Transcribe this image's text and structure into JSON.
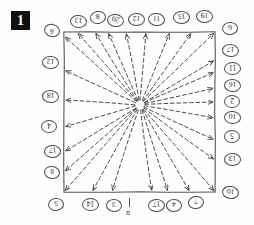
{
  "figure": {
    "badge_label": "1",
    "caption_glyph": "n",
    "ink_color": "#3a3a3a",
    "box_color": "#555555",
    "background_color": "#fefefe"
  },
  "chart_data": {
    "type": "scatter",
    "title": "",
    "xlabel": "",
    "ylabel": "",
    "source_point": {
      "x": 140,
      "y": 105
    },
    "box": {
      "left": 64,
      "top": 32,
      "right": 215,
      "bottom": 192
    },
    "grid": false,
    "legend": false,
    "arrows": [
      {
        "id": 1,
        "label": "9",
        "side": "left",
        "tip_x": 64,
        "tip_y": 36,
        "label_x": 44,
        "label_y": 24,
        "rot": 15
      },
      {
        "id": 2,
        "label": "13",
        "side": "top",
        "tip_x": 77,
        "tip_y": 32,
        "label_x": 70,
        "label_y": 15,
        "rot": 185
      },
      {
        "id": 3,
        "label": "8",
        "side": "top",
        "tip_x": 95,
        "tip_y": 32,
        "label_x": 90,
        "label_y": 11,
        "rot": 170
      },
      {
        "id": 4,
        "label": "20",
        "side": "top",
        "tip_x": 108,
        "tip_y": 32,
        "label_x": 107,
        "label_y": 14,
        "rot": 190
      },
      {
        "id": 5,
        "label": "12",
        "side": "top",
        "tip_x": 126,
        "tip_y": 32,
        "label_x": 128,
        "label_y": 13,
        "rot": 182
      },
      {
        "id": 6,
        "label": "11",
        "side": "top",
        "tip_x": 146,
        "tip_y": 32,
        "label_x": 148,
        "label_y": 13,
        "rot": 186
      },
      {
        "id": 7,
        "label": "15",
        "side": "top",
        "tip_x": 170,
        "tip_y": 32,
        "label_x": 173,
        "label_y": 11,
        "rot": 178
      },
      {
        "id": 8,
        "label": "19",
        "side": "top",
        "tip_x": 192,
        "tip_y": 32,
        "label_x": 196,
        "label_y": 10,
        "rot": 182
      },
      {
        "id": 9,
        "label": "6",
        "side": "corner",
        "tip_x": 215,
        "tip_y": 32,
        "label_x": 222,
        "label_y": 22,
        "rot": 176
      },
      {
        "id": 10,
        "label": "17",
        "side": "right",
        "tip_x": 215,
        "tip_y": 60,
        "label_x": 222,
        "label_y": 44,
        "rot": 183
      },
      {
        "id": 11,
        "label": "11",
        "side": "right",
        "tip_x": 215,
        "tip_y": 72,
        "label_x": 224,
        "label_y": 62,
        "rot": 180
      },
      {
        "id": 12,
        "label": "16",
        "side": "right",
        "tip_x": 215,
        "tip_y": 88,
        "label_x": 224,
        "label_y": 79,
        "rot": 184
      },
      {
        "id": 13,
        "label": "2",
        "side": "right",
        "tip_x": 215,
        "tip_y": 102,
        "label_x": 224,
        "label_y": 95,
        "rot": 180
      },
      {
        "id": 14,
        "label": "10",
        "side": "right",
        "tip_x": 215,
        "tip_y": 118,
        "label_x": 224,
        "label_y": 111,
        "rot": 185
      },
      {
        "id": 15,
        "label": "5",
        "side": "right",
        "tip_x": 215,
        "tip_y": 140,
        "label_x": 224,
        "label_y": 130,
        "rot": 180
      },
      {
        "id": 16,
        "label": "13",
        "side": "right",
        "tip_x": 215,
        "tip_y": 160,
        "label_x": 224,
        "label_y": 153,
        "rot": 182
      },
      {
        "id": 17,
        "label": "10",
        "side": "corner",
        "tip_x": 215,
        "tip_y": 192,
        "label_x": 222,
        "label_y": 186,
        "rot": 188
      },
      {
        "id": 18,
        "label": "7",
        "side": "bottom",
        "tip_x": 190,
        "tip_y": 192,
        "label_x": 188,
        "label_y": 196,
        "rot": 174
      },
      {
        "id": 19,
        "label": "4",
        "side": "bottom",
        "tip_x": 168,
        "tip_y": 192,
        "label_x": 166,
        "label_y": 199,
        "rot": 182
      },
      {
        "id": 20,
        "label": "17",
        "side": "bottom",
        "tip_x": 152,
        "tip_y": 192,
        "label_x": 148,
        "label_y": 199,
        "rot": 178
      },
      {
        "id": 21,
        "label": "3",
        "side": "bottom",
        "tip_x": 112,
        "tip_y": 192,
        "label_x": 106,
        "label_y": 199,
        "rot": 184
      },
      {
        "id": 22,
        "label": "14",
        "side": "bottom",
        "tip_x": 92,
        "tip_y": 192,
        "label_x": 82,
        "label_y": 198,
        "rot": 180
      },
      {
        "id": 23,
        "label": "5",
        "side": "corner",
        "tip_x": 64,
        "tip_y": 192,
        "label_x": 48,
        "label_y": 198,
        "rot": 176
      },
      {
        "id": 24,
        "label": "8",
        "side": "left",
        "tip_x": 64,
        "tip_y": 172,
        "label_x": 44,
        "label_y": 166,
        "rot": 186
      },
      {
        "id": 25,
        "label": "17",
        "side": "left",
        "tip_x": 64,
        "tip_y": 152,
        "label_x": 44,
        "label_y": 145,
        "rot": 178
      },
      {
        "id": 26,
        "label": "4",
        "side": "left",
        "tip_x": 64,
        "tip_y": 127,
        "label_x": 41,
        "label_y": 120,
        "rot": 180
      },
      {
        "id": 27,
        "label": "18",
        "side": "left",
        "tip_x": 64,
        "tip_y": 100,
        "label_x": 42,
        "label_y": 90,
        "rot": 183
      },
      {
        "id": 28,
        "label": "12",
        "side": "left",
        "tip_x": 64,
        "tip_y": 70,
        "label_x": 42,
        "label_y": 56,
        "rot": 184
      }
    ],
    "bottom_tick": {
      "x": 129,
      "y": 198,
      "glyph": "n"
    }
  }
}
